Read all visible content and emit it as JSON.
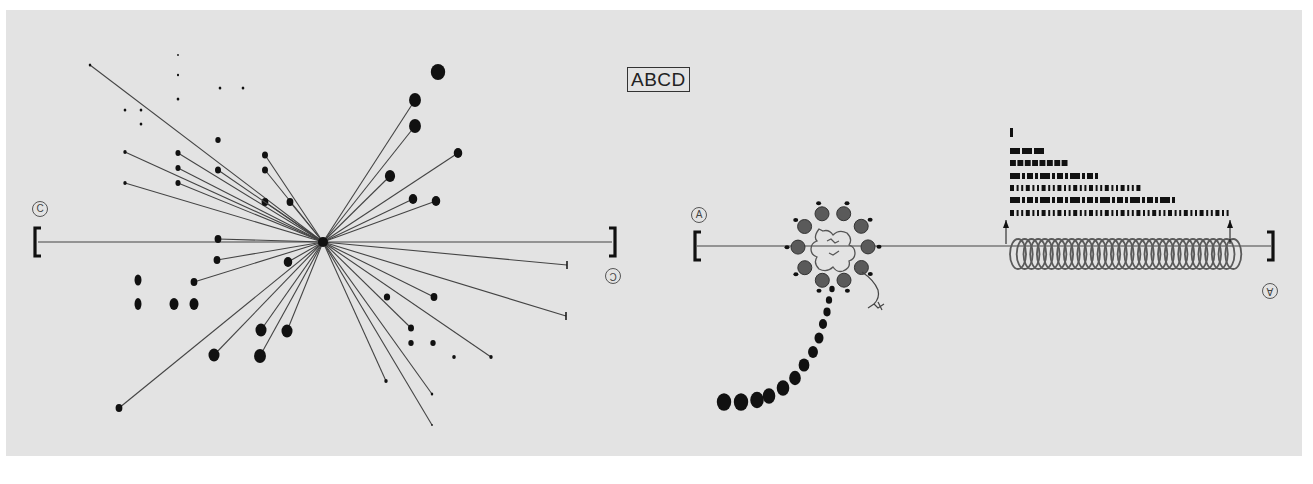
{
  "figure": {
    "title_box": "ABCD",
    "background": "#e3e3e3",
    "ink": "#111111",
    "line_color": "#444444"
  },
  "left_panel": {
    "label_left": "C",
    "label_right": "C",
    "hub": {
      "x": 323,
      "y": 242
    },
    "axis": {
      "x1": 38,
      "x2": 612,
      "y": 242
    },
    "spokes": [
      {
        "x": 90,
        "y": 65,
        "r": 1.5
      },
      {
        "x": 125,
        "y": 152,
        "r": 2
      },
      {
        "x": 125,
        "y": 183,
        "r": 2
      },
      {
        "x": 178,
        "y": 153,
        "r": 3
      },
      {
        "x": 178,
        "y": 168,
        "r": 3
      },
      {
        "x": 178,
        "y": 183,
        "r": 3
      },
      {
        "x": 265,
        "y": 155,
        "r": 3.5
      },
      {
        "x": 265,
        "y": 170,
        "r": 3.5
      },
      {
        "x": 265,
        "y": 202,
        "r": 4
      },
      {
        "x": 290,
        "y": 202,
        "r": 4
      },
      {
        "x": 218,
        "y": 170,
        "r": 3.5
      },
      {
        "x": 218,
        "y": 239,
        "r": 4
      },
      {
        "x": 217,
        "y": 260,
        "r": 4
      },
      {
        "x": 194,
        "y": 282,
        "r": 4
      },
      {
        "x": 288,
        "y": 262,
        "r": 5
      },
      {
        "x": 261,
        "y": 330,
        "r": 6.5
      },
      {
        "x": 287,
        "y": 331,
        "r": 6.5
      },
      {
        "x": 214,
        "y": 355,
        "r": 6.5
      },
      {
        "x": 260,
        "y": 356,
        "r": 7
      },
      {
        "x": 119,
        "y": 408,
        "r": 4
      },
      {
        "x": 390,
        "y": 176,
        "r": 6
      },
      {
        "x": 413,
        "y": 199,
        "r": 5
      },
      {
        "x": 436,
        "y": 201,
        "r": 5
      },
      {
        "x": 415,
        "y": 126,
        "r": 7
      },
      {
        "x": 415,
        "y": 100,
        "r": 7
      },
      {
        "x": 458,
        "y": 153,
        "r": 5
      },
      {
        "x": 567,
        "y": 265,
        "r": 0
      },
      {
        "x": 566,
        "y": 316,
        "r": 0
      },
      {
        "x": 434,
        "y": 297,
        "r": 4
      },
      {
        "x": 411,
        "y": 328,
        "r": 3.5
      },
      {
        "x": 491,
        "y": 357,
        "r": 2
      },
      {
        "x": 386,
        "y": 381,
        "r": 2
      },
      {
        "x": 432,
        "y": 394,
        "r": 1.5
      },
      {
        "x": 432,
        "y": 425,
        "r": 1
      }
    ],
    "free_dots": [
      {
        "x": 178,
        "y": 55,
        "r": 1
      },
      {
        "x": 178,
        "y": 75,
        "r": 1.2
      },
      {
        "x": 178,
        "y": 99,
        "r": 1.5
      },
      {
        "x": 220,
        "y": 88,
        "r": 1.5
      },
      {
        "x": 243,
        "y": 88,
        "r": 1.5
      },
      {
        "x": 125,
        "y": 110,
        "r": 1.5
      },
      {
        "x": 141,
        "y": 110,
        "r": 1.5
      },
      {
        "x": 141,
        "y": 124,
        "r": 1.5
      },
      {
        "x": 218,
        "y": 140,
        "r": 3
      },
      {
        "x": 138,
        "y": 280,
        "rx": 3.5,
        "ry": 5.5
      },
      {
        "x": 138,
        "y": 304,
        "rx": 3.5,
        "ry": 6
      },
      {
        "x": 174,
        "y": 304,
        "rx": 4.5,
        "ry": 6
      },
      {
        "x": 194,
        "y": 304,
        "rx": 4.5,
        "ry": 6
      },
      {
        "x": 438,
        "y": 72,
        "r": 8
      },
      {
        "x": 387,
        "y": 297,
        "r": 3.5
      },
      {
        "x": 411,
        "y": 343,
        "r": 3
      },
      {
        "x": 433,
        "y": 343,
        "r": 3
      },
      {
        "x": 454,
        "y": 357,
        "r": 2
      }
    ]
  },
  "right_panel": {
    "label_left": "A",
    "label_right": "A",
    "axis": {
      "x1": 697,
      "x2": 1271,
      "y": 246
    },
    "rosette": {
      "cx": 833,
      "cy": 247,
      "spheres": 10,
      "radius": 35
    },
    "tail_beads": [
      {
        "x": 832,
        "y": 289,
        "r": 3
      },
      {
        "x": 829,
        "y": 300,
        "r": 3.5
      },
      {
        "x": 827,
        "y": 312,
        "r": 4
      },
      {
        "x": 823,
        "y": 324,
        "r": 4.5
      },
      {
        "x": 819,
        "y": 338,
        "r": 5
      },
      {
        "x": 813,
        "y": 352,
        "r": 5.5
      },
      {
        "x": 804,
        "y": 365,
        "r": 6
      },
      {
        "x": 795,
        "y": 378,
        "r": 6.5
      },
      {
        "x": 783,
        "y": 388,
        "r": 7
      },
      {
        "x": 769,
        "y": 396,
        "r": 7
      },
      {
        "x": 757,
        "y": 400,
        "r": 7.5
      },
      {
        "x": 741,
        "y": 402,
        "r": 8
      },
      {
        "x": 724,
        "y": 402,
        "r": 8
      }
    ],
    "coil": {
      "x1": 1008,
      "x2": 1230,
      "y": 254,
      "turns": 33
    },
    "bar_rows": [
      {
        "y": 133,
        "x2": 1016,
        "pattern": "single"
      },
      {
        "y": 151,
        "x2": 1046,
        "pattern": "blocks-3"
      },
      {
        "y": 163,
        "x2": 1069,
        "pattern": "blocks-8"
      },
      {
        "y": 176,
        "x2": 1098,
        "pattern": "mixed"
      },
      {
        "y": 188,
        "x2": 1137,
        "pattern": "thin"
      },
      {
        "y": 200,
        "x2": 1177,
        "pattern": "mixed"
      },
      {
        "y": 213,
        "x2": 1230,
        "pattern": "thin"
      }
    ]
  }
}
